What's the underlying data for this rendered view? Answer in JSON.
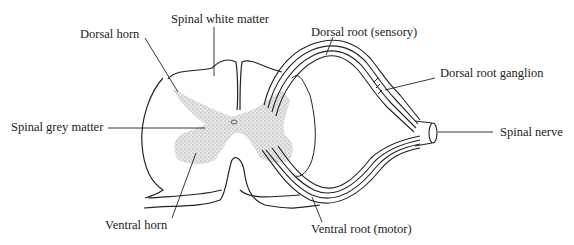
{
  "diagram": {
    "labels": {
      "spinal_white_matter": "Spinal white matter",
      "dorsal_horn": "Dorsal horn",
      "dorsal_root": "Dorsal root (sensory)",
      "dorsal_root_ganglion": "Dorsal root ganglion",
      "spinal_grey_matter": "Spinal grey matter",
      "spinal_nerve": "Spinal nerve",
      "ventral_horn": "Ventral horn",
      "ventral_root": "Ventral root (motor)"
    },
    "colors": {
      "line": "#222222",
      "grey_matter_fill": "#d4d4d4",
      "background": "#ffffff"
    }
  }
}
